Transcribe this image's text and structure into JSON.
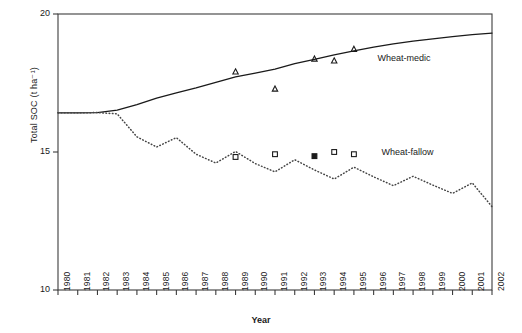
{
  "chart_data": {
    "type": "line",
    "title": "",
    "xlabel": "Year",
    "ylabel": "Total SOC (t ha⁻¹)",
    "xlim": [
      1980,
      2002
    ],
    "ylim": [
      10,
      20
    ],
    "yticks": [
      10,
      15,
      20
    ],
    "ytick_labels": [
      "10",
      "15",
      "20"
    ],
    "grid": false,
    "legend_position": "inline-right",
    "x": [
      1980,
      1981,
      1982,
      1983,
      1984,
      1985,
      1986,
      1987,
      1988,
      1989,
      1990,
      1991,
      1992,
      1993,
      1994,
      1995,
      1996,
      1997,
      1998,
      1999,
      2000,
      2001,
      2002
    ],
    "series": [
      {
        "name": "Wheat-medic",
        "style": "solid",
        "marker": "none",
        "color": "#1a1a1a",
        "values": [
          16.42,
          16.42,
          16.43,
          16.52,
          16.72,
          16.95,
          17.14,
          17.32,
          17.52,
          17.72,
          17.86,
          18.0,
          18.2,
          18.36,
          18.52,
          18.66,
          18.8,
          18.92,
          19.02,
          19.1,
          19.18,
          19.25,
          19.31
        ]
      },
      {
        "name": "Wheat-fallow",
        "style": "dotted",
        "marker": "none",
        "color": "#444444",
        "values": [
          16.42,
          16.42,
          16.43,
          16.38,
          15.55,
          15.18,
          15.52,
          14.92,
          14.6,
          15.02,
          14.58,
          14.28,
          14.72,
          14.35,
          14.02,
          14.45,
          14.1,
          13.78,
          14.12,
          13.8,
          13.5,
          13.88,
          13.02
        ]
      }
    ],
    "observations": [
      {
        "name": "Wheat-medic observed",
        "marker": "open-triangle",
        "color": "#1a1a1a",
        "points": [
          {
            "x": 1989,
            "y": 17.9
          },
          {
            "x": 1991,
            "y": 17.28
          },
          {
            "x": 1993,
            "y": 18.37
          },
          {
            "x": 1994,
            "y": 18.3
          },
          {
            "x": 1995,
            "y": 18.72
          }
        ]
      },
      {
        "name": "Wheat-fallow observed",
        "marker": "open-square",
        "color": "#1a1a1a",
        "points": [
          {
            "x": 1989,
            "y": 14.82
          },
          {
            "x": 1991,
            "y": 14.92
          },
          {
            "x": 1994,
            "y": 15.0
          },
          {
            "x": 1995,
            "y": 14.92
          }
        ]
      },
      {
        "name": "Wheat-fallow observed filled",
        "marker": "filled-square",
        "color": "#1a1a1a",
        "points": [
          {
            "x": 1993,
            "y": 14.85
          }
        ]
      }
    ],
    "annotations": [
      {
        "text": "Wheat-medic",
        "x": 1996.2,
        "y": 18.38
      },
      {
        "text": "Wheat-fallow",
        "x": 1996.4,
        "y": 14.95
      }
    ],
    "legend_markers": [
      {
        "text": "Wheat-medic",
        "marker": "none"
      },
      {
        "text": "Wheat-fallow",
        "marker": "open-square",
        "x": 1995,
        "y": 14.92
      }
    ]
  },
  "axis": {
    "x_tick_labels": [
      "1980",
      "1981",
      "1982",
      "1983",
      "1984",
      "1985",
      "1986",
      "1987",
      "1988",
      "1989",
      "1990",
      "1991",
      "1992",
      "1993",
      "1994",
      "1995",
      "1996",
      "1997",
      "1998",
      "1999",
      "2000",
      "2001",
      "2002"
    ],
    "y_tick_labels": [
      "20",
      "15",
      "10"
    ],
    "x_title": "Year",
    "y_title": "Total SOC (t ha⁻¹)"
  },
  "labels": {
    "wheat_medic": "Wheat-medic",
    "wheat_fallow": "Wheat-fallow"
  }
}
